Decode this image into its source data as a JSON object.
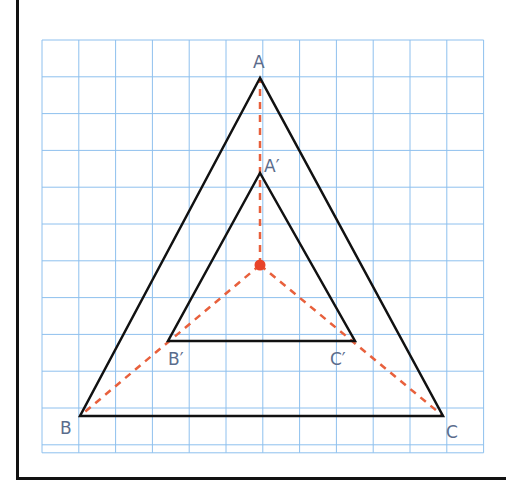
{
  "chart_data": {
    "type": "diagram",
    "title": "",
    "grid": {
      "columns": 12,
      "rows": 11,
      "origin_px": [
        42,
        40
      ],
      "cell_px": 36.8,
      "color": "#8ec0ee"
    },
    "center": {
      "px": [
        260,
        265
      ],
      "color": "#e8442a"
    },
    "triangles": [
      {
        "name": "ABC",
        "vertices": {
          "A": [
            260,
            78
          ],
          "B": [
            80,
            416
          ],
          "C": [
            443,
            416
          ]
        }
      },
      {
        "name": "A'B'C'",
        "vertices": {
          "A'": [
            260,
            173
          ],
          "B'": [
            168,
            341
          ],
          "C'": [
            355,
            341
          ]
        }
      }
    ],
    "rays_color": "#e8603c",
    "labels": {
      "A": "A",
      "B": "B",
      "C": "C",
      "A_prime": "A′",
      "B_prime": "B′",
      "C_prime": "C′"
    }
  }
}
